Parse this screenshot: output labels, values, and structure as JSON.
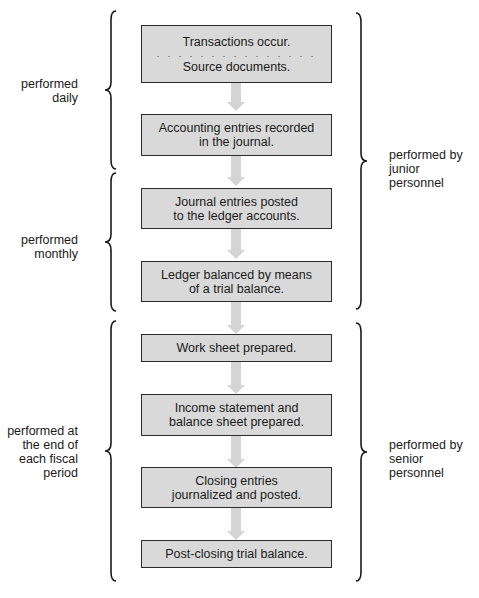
{
  "flowchart": {
    "steps": [
      {
        "line1": "Transactions occur.",
        "separator": ". . . . . . . . . . . . . . .",
        "line2": "Source documents."
      },
      {
        "line1": "Accounting entries recorded",
        "line2": "in the journal."
      },
      {
        "line1": "Journal entries posted",
        "line2": "to the ledger accounts."
      },
      {
        "line1": "Ledger balanced by means",
        "line2": "of a trial balance."
      },
      {
        "line1": "Work sheet prepared."
      },
      {
        "line1": "Income statement and",
        "line2": "balance sheet prepared."
      },
      {
        "line1": "Closing entries",
        "line2": "journalized and posted."
      },
      {
        "line1": "Post-closing trial balance."
      }
    ]
  },
  "left_labels": [
    {
      "lines": [
        "performed",
        "daily"
      ]
    },
    {
      "lines": [
        "performed",
        "monthly"
      ]
    },
    {
      "lines": [
        "performed at",
        "the end of",
        "each fiscal",
        "period"
      ]
    }
  ],
  "right_labels": [
    {
      "lines": [
        "performed by",
        "junior",
        "personnel"
      ]
    },
    {
      "lines": [
        "performed by",
        "senior",
        "personnel"
      ]
    }
  ],
  "colors": {
    "box_fill": "#d9d9d9",
    "box_border": "#2a2a2a",
    "arrow": "#d4d4d4",
    "text": "#1a1a1a"
  }
}
